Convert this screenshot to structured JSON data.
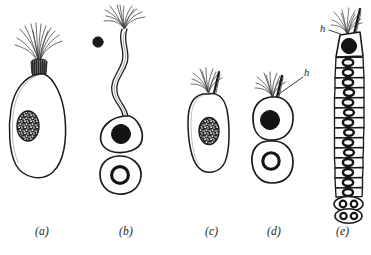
{
  "figure": {
    "background_color": "#ffffff",
    "ink_color": "#1a1a1a",
    "panel_count": 5
  },
  "panels": [
    {
      "id": "a",
      "label": "(a)",
      "label_x": 42,
      "label_y": 232,
      "description": "Pear-shaped single cell with apical tuft of flagella and granular stippled nucleus",
      "nucleus_type": "stippled-granular",
      "has_flagella_tuft": true,
      "cell_count": 1
    },
    {
      "id": "b",
      "label": "(b)",
      "label_x": 126,
      "label_y": 232,
      "description": "Long wavy stalk bearing apical flagellar tuft, a free dark granule beside it, and two cells below",
      "nucleus_type": "solid-dark and ring",
      "has_flagella_tuft": true,
      "cell_count": 2
    },
    {
      "id": "c",
      "label": "(c)",
      "label_x": 212,
      "label_y": 232,
      "description": "Elongated single cell with apical flagellar tuft and granular stippled nucleus",
      "nucleus_type": "stippled-granular",
      "has_flagella_tuft": true,
      "cell_count": 1
    },
    {
      "id": "d",
      "label": "(d)",
      "label_x": 274,
      "label_y": 232,
      "description": "Two stacked cells; upper with solid dark nucleus and flagellar tuft, lower with ring nucleus",
      "nucleus_type": "solid-dark and ring",
      "has_flagella_tuft": true,
      "cell_count": 2,
      "annotation": "h"
    },
    {
      "id": "e",
      "label": "(e)",
      "label_x": 342,
      "label_y": 232,
      "description": "Long chain filament of stacked rectangular cells with ring nuclei; apical head cell bears flagellar tuft and solid dark nucleus; basal cells are dividing with paired nuclei",
      "nucleus_type": "ring",
      "has_flagella_tuft": true,
      "cell_count": 18,
      "annotation": "h"
    }
  ],
  "annotations": [
    {
      "id": "h-panel-d",
      "text": "h",
      "x": 305,
      "y": 72,
      "panel": "d",
      "leader_from": [
        303,
        76
      ],
      "leader_to": [
        275,
        95
      ]
    },
    {
      "id": "h-panel-e",
      "text": "h",
      "x": 323,
      "y": 29,
      "panel": "e",
      "leader_from": [
        330,
        31
      ],
      "leader_to": [
        345,
        38
      ]
    }
  ]
}
